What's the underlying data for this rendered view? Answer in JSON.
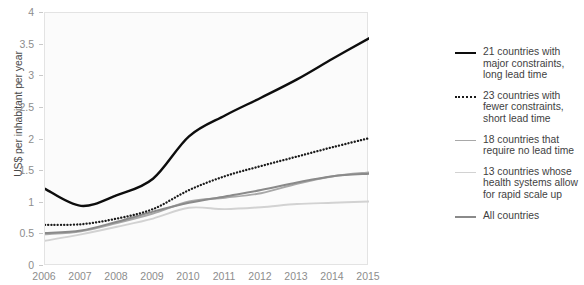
{
  "chart_data": {
    "type": "line",
    "title": "",
    "xlabel": "",
    "ylabel": "US$ per inhabitant per year",
    "x": [
      2006,
      2007,
      2008,
      2009,
      2010,
      2011,
      2012,
      2013,
      2014,
      2015
    ],
    "xlim": [
      2006,
      2015
    ],
    "ylim": [
      0,
      4
    ],
    "ytick_labels": [
      "0",
      "0.5",
      "1",
      "1.5",
      "2",
      "2.5",
      "3",
      "3.5",
      "4"
    ],
    "ytick_values": [
      0,
      0.5,
      1,
      1.5,
      2,
      2.5,
      3,
      3.5,
      4
    ],
    "xtick_labels": [
      "2006",
      "2007",
      "2008",
      "2009",
      "2010",
      "2011",
      "2012",
      "2013",
      "2014",
      "2015"
    ],
    "grid": false,
    "legend_position": "right",
    "series": [
      {
        "name": "21 countries with major constraints, long lead time",
        "color": "#0d0d0d",
        "style": "solid",
        "width": 2.4,
        "values": [
          1.22,
          0.95,
          1.12,
          1.38,
          2.05,
          2.38,
          2.66,
          2.95,
          3.28,
          3.6
        ]
      },
      {
        "name": "23 countries with fewer constraints, short lead time",
        "color": "#1a1a1a",
        "style": "dotted",
        "width": 2.3,
        "values": [
          0.65,
          0.66,
          0.75,
          0.9,
          1.2,
          1.42,
          1.58,
          1.73,
          1.88,
          2.02
        ]
      },
      {
        "name": "18 countries that require no lead time",
        "color": "#a8a8a8",
        "style": "solid",
        "width": 1.9,
        "values": [
          0.5,
          0.55,
          0.68,
          0.83,
          1.02,
          1.08,
          1.15,
          1.3,
          1.42,
          1.48
        ]
      },
      {
        "name": "13 countries whose health systems allow for rapid scale up",
        "color": "#d2d2d2",
        "style": "solid",
        "width": 1.9,
        "values": [
          0.4,
          0.5,
          0.62,
          0.75,
          0.92,
          0.9,
          0.93,
          0.98,
          1.0,
          1.02
        ]
      },
      {
        "name": "All countries",
        "color": "#8a8a8a",
        "style": "solid",
        "width": 2.0,
        "values": [
          0.52,
          0.56,
          0.7,
          0.86,
          1.0,
          1.1,
          1.2,
          1.32,
          1.42,
          1.46
        ]
      }
    ]
  },
  "axis": {
    "y_title": "US$ per inhabitant per year"
  },
  "legend": {
    "items": [
      {
        "label": "21 countries with major constraints, long lead time",
        "swatch": "solid-black"
      },
      {
        "label": "23 countries with fewer constraints, short lead time",
        "swatch": "dotted-black"
      },
      {
        "label": "18 countries that require no lead time",
        "swatch": "solid-mid-gray"
      },
      {
        "label": "13 countries whose health systems allow for rapid scale up",
        "swatch": "solid-light-gray"
      },
      {
        "label": "All countries",
        "swatch": "solid-dark-gray"
      }
    ]
  }
}
